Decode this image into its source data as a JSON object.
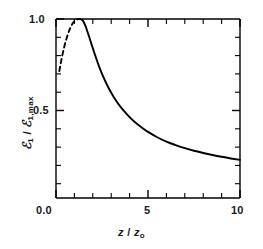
{
  "chart_data": {
    "type": "line",
    "title": "",
    "xlabel": "z / z₀",
    "ylabel": "ℰ₁ / ℰ₁,max",
    "xlim": [
      0.0,
      10.0
    ],
    "ylim": [
      0.0,
      1.05
    ],
    "grid": false,
    "legend": null,
    "xticks": [
      {
        "value": 0.0,
        "label": "0.0"
      },
      {
        "value": 5.0,
        "label": "5"
      },
      {
        "value": 10.0,
        "label": "10"
      }
    ],
    "xminor_ticks": [
      1,
      2,
      3,
      4,
      6,
      7,
      8,
      9
    ],
    "yticks": [
      {
        "value": 1.0,
        "label": "1.0"
      },
      {
        "value": 0.5,
        "label": "0.5"
      }
    ],
    "yminor_ticks": [
      0.1,
      0.2,
      0.3,
      0.4,
      0.6,
      0.7,
      0.8,
      0.9
    ],
    "series": [
      {
        "name": "extrapolated-rise",
        "style": "dashed",
        "color": "#000000",
        "x": [
          0.18,
          0.3,
          0.45,
          0.6,
          0.75,
          0.9,
          1.0,
          1.1,
          1.2,
          1.3
        ],
        "y": [
          0.715,
          0.78,
          0.848,
          0.903,
          0.945,
          0.975,
          0.988,
          0.996,
          1.0,
          1.0
        ]
      },
      {
        "name": "decay",
        "style": "solid",
        "color": "#000000",
        "x": [
          1.3,
          1.45,
          1.6,
          1.75,
          1.9,
          2.1,
          2.3,
          2.5,
          2.75,
          3.0,
          3.25,
          3.5,
          3.75,
          4.0,
          4.25,
          4.5,
          4.75,
          5.0,
          5.5,
          6.0,
          6.5,
          7.0,
          7.5,
          8.0,
          8.5,
          9.0,
          9.5,
          10.0
        ],
        "y": [
          1.0,
          0.992,
          0.962,
          0.918,
          0.872,
          0.81,
          0.752,
          0.7,
          0.645,
          0.597,
          0.556,
          0.521,
          0.491,
          0.464,
          0.44,
          0.419,
          0.4,
          0.383,
          0.354,
          0.33,
          0.311,
          0.294,
          0.28,
          0.268,
          0.257,
          0.247,
          0.238,
          0.23
        ]
      }
    ]
  },
  "axes": {
    "x_tick_labels": [
      "0.0",
      "5",
      "10"
    ],
    "y_tick_labels": [
      "1.0",
      "0.5"
    ],
    "x_axis_title_main": "z",
    "x_axis_title_sep": " / ",
    "x_axis_title_var": "z",
    "x_axis_title_subscript": "o",
    "y_axis_title_num": "ℰ",
    "y_axis_title_num_sub": "1",
    "y_axis_title_sep": " / ",
    "y_axis_title_den": "ℰ",
    "y_axis_title_den_sub": "1,max"
  },
  "style": {
    "line_color": "#000000",
    "axis_color": "#000000",
    "background": "#ffffff"
  }
}
